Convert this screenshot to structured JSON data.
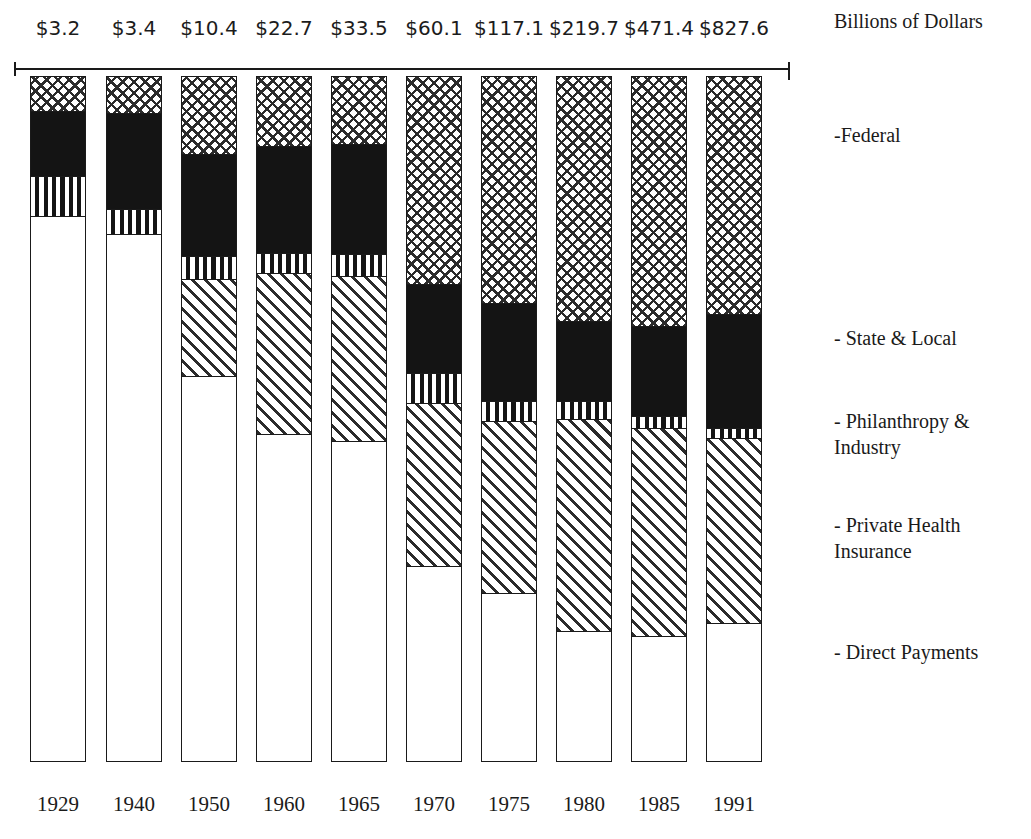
{
  "units_caption": "Billions of Dollars",
  "legend": [
    {
      "name": "federal",
      "label": "-Federal",
      "top": 122
    },
    {
      "name": "state-local",
      "label": "- State & Local",
      "top": 325
    },
    {
      "name": "philanthropy",
      "label": "- Philanthropy &\n   Industry",
      "top": 408
    },
    {
      "name": "private-health",
      "label": "- Private Health\n  Insurance",
      "top": 512
    },
    {
      "name": "direct-payments",
      "label": "- Direct Payments",
      "top": 639
    }
  ],
  "chart_data": {
    "type": "bar",
    "subtype": "stacked-bar",
    "title": "",
    "xlabel": "",
    "ylabel": "Billions of Dollars",
    "grid": false,
    "legend_position": "right",
    "categories": [
      "1929",
      "1940",
      "1950",
      "1960",
      "1965",
      "1970",
      "1975",
      "1980",
      "1985",
      "1991"
    ],
    "totals": [
      3.2,
      3.4,
      10.4,
      22.7,
      33.5,
      60.1,
      117.1,
      219.7,
      471.4,
      827.6
    ],
    "total_labels": [
      "$3.2",
      "$3.4",
      "$10.4",
      "$22.7",
      "$33.5",
      "$60.1",
      "$117.1",
      "$219.7",
      "$471.4",
      "$827.6"
    ],
    "series": [
      {
        "name": "Federal",
        "pattern": "crosshatch",
        "share_pct": [
          6.2,
          7.1,
          13.5,
          11.3,
          11.0,
          30.2,
          33.0,
          35.6,
          36.3,
          34.6
        ]
      },
      {
        "name": "State & Local",
        "pattern": "solid",
        "share_pct": [
          11.8,
          18.8,
          17.9,
          17.6,
          18.1,
          13.0,
          14.3,
          11.7,
          13.1,
          16.6
        ]
      },
      {
        "name": "Philanthropy & Industry",
        "pattern": "vstripe",
        "share_pct": [
          7.3,
          4.9,
          4.0,
          3.3,
          3.6,
          4.4,
          2.9,
          2.6,
          1.7,
          1.5
        ]
      },
      {
        "name": "Private Health Insurance",
        "pattern": "diagonal",
        "share_pct": [
          0.0,
          0.0,
          17.0,
          26.4,
          27.1,
          23.8,
          25.1,
          30.9,
          30.3,
          27.0
        ]
      },
      {
        "name": "Direct Payments",
        "pattern": "blank",
        "share_pct": [
          74.7,
          69.2,
          47.6,
          41.4,
          40.2,
          28.6,
          24.7,
          19.2,
          18.6,
          20.3
        ]
      }
    ],
    "bars": [
      {
        "year": "1929",
        "total_label": "$3.2",
        "x": 30,
        "width": 56,
        "label_x": 12,
        "label_w": 92,
        "year_x": 14,
        "year_w": 88,
        "segments": [
          {
            "series": "Federal",
            "pattern": "crosshatch",
            "top": 76,
            "bottom": 110
          },
          {
            "series": "State & Local",
            "pattern": "solid",
            "top": 110,
            "bottom": 175
          },
          {
            "series": "Philanthropy & Industry",
            "pattern": "vstripe",
            "top": 175,
            "bottom": 215
          },
          {
            "series": "Direct Payments",
            "pattern": "blank",
            "top": 215,
            "bottom": 762
          }
        ]
      },
      {
        "year": "1940",
        "total_label": "$3.4",
        "x": 106,
        "width": 56,
        "label_x": 88,
        "label_w": 92,
        "year_x": 90,
        "year_w": 88,
        "segments": [
          {
            "series": "Federal",
            "pattern": "crosshatch",
            "top": 76,
            "bottom": 112
          },
          {
            "series": "State & Local",
            "pattern": "solid",
            "top": 112,
            "bottom": 208
          },
          {
            "series": "Philanthropy & Industry",
            "pattern": "vstripe",
            "top": 208,
            "bottom": 233
          },
          {
            "series": "Direct Payments",
            "pattern": "blank",
            "top": 233,
            "bottom": 762
          }
        ]
      },
      {
        "year": "1950",
        "total_label": "$10.4",
        "x": 181,
        "width": 56,
        "label_x": 158,
        "label_w": 102,
        "year_x": 165,
        "year_w": 88,
        "segments": [
          {
            "series": "Federal",
            "pattern": "crosshatch",
            "top": 76,
            "bottom": 153
          },
          {
            "series": "State & Local",
            "pattern": "solid",
            "top": 153,
            "bottom": 255
          },
          {
            "series": "Philanthropy & Industry",
            "pattern": "vstripe",
            "top": 255,
            "bottom": 278
          },
          {
            "series": "Private Health Insurance",
            "pattern": "diagonal",
            "top": 278,
            "bottom": 375
          },
          {
            "series": "Direct Payments",
            "pattern": "blank",
            "top": 375,
            "bottom": 762
          }
        ]
      },
      {
        "year": "1960",
        "total_label": "$22.7",
        "x": 256,
        "width": 56,
        "label_x": 233,
        "label_w": 102,
        "year_x": 240,
        "year_w": 88,
        "segments": [
          {
            "series": "Federal",
            "pattern": "crosshatch",
            "top": 76,
            "bottom": 145
          },
          {
            "series": "State & Local",
            "pattern": "solid",
            "top": 145,
            "bottom": 252
          },
          {
            "series": "Philanthropy & Industry",
            "pattern": "vstripe",
            "top": 252,
            "bottom": 272
          },
          {
            "series": "Private Health Insurance",
            "pattern": "diagonal",
            "top": 272,
            "bottom": 433
          },
          {
            "series": "Direct Payments",
            "pattern": "blank",
            "top": 433,
            "bottom": 762
          }
        ]
      },
      {
        "year": "1965",
        "total_label": "$33.5",
        "x": 331,
        "width": 56,
        "label_x": 308,
        "label_w": 102,
        "year_x": 315,
        "year_w": 88,
        "segments": [
          {
            "series": "Federal",
            "pattern": "crosshatch",
            "top": 76,
            "bottom": 143
          },
          {
            "series": "State & Local",
            "pattern": "solid",
            "top": 143,
            "bottom": 253
          },
          {
            "series": "Philanthropy & Industry",
            "pattern": "vstripe",
            "top": 253,
            "bottom": 275
          },
          {
            "series": "Private Health Insurance",
            "pattern": "diagonal",
            "top": 275,
            "bottom": 440
          },
          {
            "series": "Direct Payments",
            "pattern": "blank",
            "top": 440,
            "bottom": 762
          }
        ]
      },
      {
        "year": "1970",
        "total_label": "$60.1",
        "x": 406,
        "width": 56,
        "label_x": 383,
        "label_w": 102,
        "year_x": 390,
        "year_w": 88,
        "segments": [
          {
            "series": "Federal",
            "pattern": "crosshatch",
            "top": 76,
            "bottom": 283
          },
          {
            "series": "State & Local",
            "pattern": "solid",
            "top": 283,
            "bottom": 372
          },
          {
            "series": "Philanthropy & Industry",
            "pattern": "vstripe",
            "top": 372,
            "bottom": 402
          },
          {
            "series": "Private Health Insurance",
            "pattern": "diagonal",
            "top": 402,
            "bottom": 565
          },
          {
            "series": "Direct Payments",
            "pattern": "blank",
            "top": 565,
            "bottom": 762
          }
        ]
      },
      {
        "year": "1975",
        "total_label": "$117.1",
        "x": 481,
        "width": 56,
        "label_x": 452,
        "label_w": 114,
        "year_x": 465,
        "year_w": 88,
        "segments": [
          {
            "series": "Federal",
            "pattern": "crosshatch",
            "top": 76,
            "bottom": 302
          },
          {
            "series": "State & Local",
            "pattern": "solid",
            "top": 302,
            "bottom": 400
          },
          {
            "series": "Philanthropy & Industry",
            "pattern": "vstripe",
            "top": 400,
            "bottom": 420
          },
          {
            "series": "Private Health Insurance",
            "pattern": "diagonal",
            "top": 420,
            "bottom": 592
          },
          {
            "series": "Direct Payments",
            "pattern": "blank",
            "top": 592,
            "bottom": 762
          }
        ]
      },
      {
        "year": "1980",
        "total_label": "$219.7",
        "x": 556,
        "width": 56,
        "label_x": 527,
        "label_w": 114,
        "year_x": 540,
        "year_w": 88,
        "segments": [
          {
            "series": "Federal",
            "pattern": "crosshatch",
            "top": 76,
            "bottom": 320
          },
          {
            "series": "State & Local",
            "pattern": "solid",
            "top": 320,
            "bottom": 400
          },
          {
            "series": "Philanthropy & Industry",
            "pattern": "vstripe",
            "top": 400,
            "bottom": 418
          },
          {
            "series": "Private Health Insurance",
            "pattern": "diagonal",
            "top": 418,
            "bottom": 630
          },
          {
            "series": "Direct Payments",
            "pattern": "blank",
            "top": 630,
            "bottom": 762
          }
        ]
      },
      {
        "year": "1985",
        "total_label": "$471.4",
        "x": 631,
        "width": 56,
        "label_x": 602,
        "label_w": 114,
        "year_x": 615,
        "year_w": 88,
        "segments": [
          {
            "series": "Federal",
            "pattern": "crosshatch",
            "top": 76,
            "bottom": 325
          },
          {
            "series": "State & Local",
            "pattern": "solid",
            "top": 325,
            "bottom": 415
          },
          {
            "series": "Philanthropy & Industry",
            "pattern": "vstripe",
            "top": 415,
            "bottom": 427
          },
          {
            "series": "Private Health Insurance",
            "pattern": "diagonal",
            "top": 427,
            "bottom": 635
          },
          {
            "series": "Direct Payments",
            "pattern": "blank",
            "top": 635,
            "bottom": 762
          }
        ]
      },
      {
        "year": "1991",
        "total_label": "$827.6",
        "x": 706,
        "width": 56,
        "label_x": 677,
        "label_w": 114,
        "year_x": 690,
        "year_w": 88,
        "segments": [
          {
            "series": "Federal",
            "pattern": "crosshatch",
            "top": 76,
            "bottom": 313
          },
          {
            "series": "State & Local",
            "pattern": "solid",
            "top": 313,
            "bottom": 427
          },
          {
            "series": "Philanthropy & Industry",
            "pattern": "vstripe",
            "top": 427,
            "bottom": 437
          },
          {
            "series": "Private Health Insurance",
            "pattern": "diagonal",
            "top": 437,
            "bottom": 622
          },
          {
            "series": "Direct Payments",
            "pattern": "blank",
            "top": 622,
            "bottom": 762
          }
        ]
      }
    ]
  }
}
